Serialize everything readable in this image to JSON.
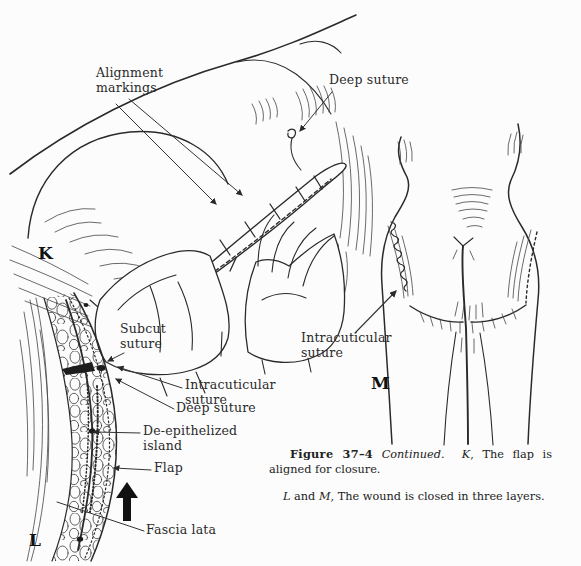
{
  "panel_k": {
    "letter": "K",
    "labels": {
      "alignment_markings": "Alignment markings",
      "deep_suture": "Deep suture"
    }
  },
  "panel_l": {
    "letter": "L",
    "labels": {
      "subcut_suture": "Subcut suture",
      "intracuticular_suture": "Intracuticular suture",
      "deep_suture": "Deep suture",
      "de_epithelized_island": "De-epithelized island",
      "flap": "Flap",
      "fascia_lata": "Fascia lata"
    }
  },
  "panel_m": {
    "letter": "M",
    "labels": {
      "intracuticular_suture": "Intracuticular suture"
    }
  },
  "caption": {
    "figure_label": "Figure 37–4",
    "continued": "Continued.",
    "k_ref": "K",
    "k_text": ", The flap is aligned for closure.",
    "l_ref": "L",
    "and_word": "and",
    "m_ref": "M",
    "lm_text": ", The wound is closed in three layers."
  },
  "colors": {
    "ink": "#2a2a2a",
    "paper": "#fcfcfc"
  }
}
